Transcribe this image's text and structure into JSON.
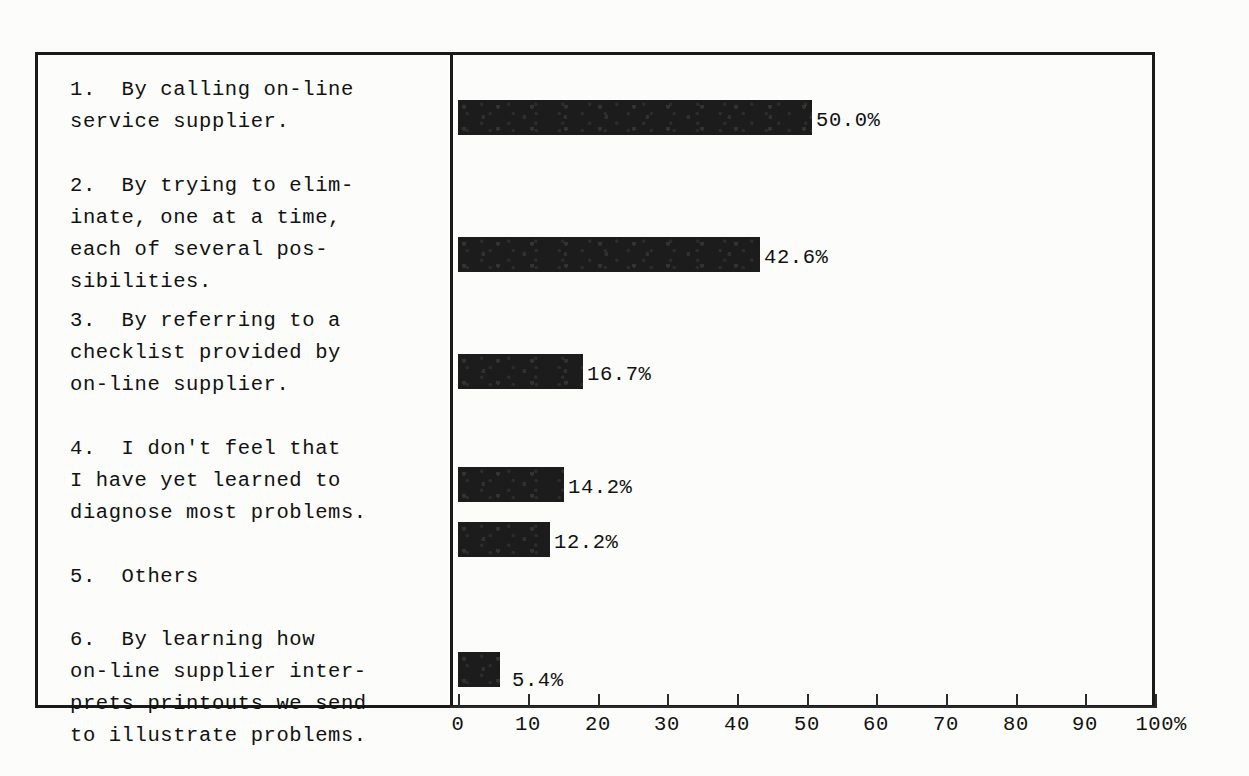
{
  "chart_data": {
    "type": "bar",
    "orientation": "horizontal",
    "title": "",
    "xlabel": "",
    "ylabel": "",
    "xlim": [
      0,
      100
    ],
    "xticks": [
      0,
      10,
      20,
      30,
      40,
      50,
      60,
      70,
      80,
      90,
      100
    ],
    "xtick_labels": [
      "0",
      "10",
      "20",
      "30",
      "40",
      "50",
      "60",
      "70",
      "80",
      "90",
      "100%"
    ],
    "grid": false,
    "legend": false,
    "bar_color": "#1c1c1c",
    "categories": [
      "1.  By calling on-line service supplier.",
      "2.  By trying to eliminate, one at a time, each of several possibilities.",
      "3.  By referring to a checklist provided by on-line supplier.",
      "4.  I don't feel that I have yet learned to diagnose most problems.",
      "5.  Others",
      "6.  By learning how on-line supplier interprets printouts we send to illustrate problems."
    ],
    "values": [
      50.0,
      42.6,
      16.7,
      14.2,
      12.2,
      5.4
    ],
    "value_labels": [
      "50.0%",
      "42.6%",
      "16.7%",
      "14.2%",
      "12.2%",
      "5.4%"
    ]
  },
  "labels": [
    {
      "id": "item-1",
      "top": 22,
      "lines": "1.  By calling on-line\nservice supplier."
    },
    {
      "id": "item-2",
      "top": 118,
      "lines": "2.  By trying to elim-\ninate, one at a time,\neach of several pos-\nsibilities."
    },
    {
      "id": "item-3",
      "top": 253,
      "lines": "3.  By referring to a\nchecklist provided by\non-line supplier."
    },
    {
      "id": "item-4",
      "top": 381,
      "lines": "4.  I don't feel that\nI have yet learned to\ndiagnose most problems."
    },
    {
      "id": "item-5",
      "top": 509,
      "lines": "5.  Others"
    },
    {
      "id": "item-6",
      "top": 572,
      "lines": "6.  By learning how\non-line supplier inter-\nprets printouts we send\nto illustrate problems."
    }
  ],
  "bars": [
    {
      "id": "bar-1",
      "value_label": "50.0%",
      "top": 48,
      "width": 354,
      "label_left": 366,
      "label_top": 58
    },
    {
      "id": "bar-2",
      "value_label": "42.6%",
      "top": 185,
      "width": 302,
      "label_left": 314,
      "label_top": 195
    },
    {
      "id": "bar-3",
      "value_label": "16.7%",
      "top": 302,
      "width": 125,
      "label_left": 137,
      "label_top": 312
    },
    {
      "id": "bar-4",
      "value_label": "14.2%",
      "top": 415,
      "width": 106,
      "label_left": 118,
      "label_top": 425
    },
    {
      "id": "bar-5",
      "value_label": "12.2%",
      "top": 470,
      "width": 92,
      "label_left": 104,
      "label_top": 480
    },
    {
      "id": "bar-6",
      "value_label": "5.4%",
      "top": 600,
      "width": 42,
      "label_left": 62,
      "label_top": 618
    }
  ],
  "bar_height": 35,
  "axis": {
    "ticks": [
      {
        "label": "0",
        "x": 458
      },
      {
        "label": "10",
        "x": 528
      },
      {
        "label": "20",
        "x": 598
      },
      {
        "label": "30",
        "x": 667
      },
      {
        "label": "40",
        "x": 737
      },
      {
        "label": "50",
        "x": 807
      },
      {
        "label": "60",
        "x": 876
      },
      {
        "label": "70",
        "x": 946
      },
      {
        "label": "80",
        "x": 1016
      },
      {
        "label": "90",
        "x": 1085
      },
      {
        "label": "100%",
        "x": 1155
      }
    ]
  }
}
